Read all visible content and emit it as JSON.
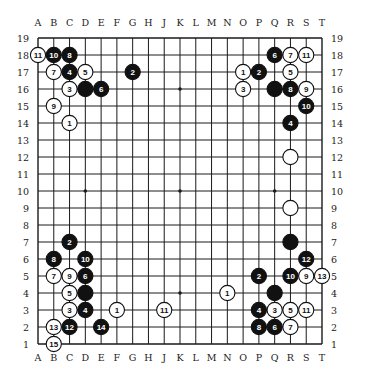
{
  "board": {
    "size": 19,
    "columns": [
      "A",
      "B",
      "C",
      "D",
      "E",
      "F",
      "G",
      "H",
      "J",
      "K",
      "L",
      "M",
      "N",
      "O",
      "P",
      "Q",
      "R",
      "S",
      "T"
    ],
    "rows": [
      19,
      18,
      17,
      16,
      15,
      14,
      13,
      12,
      11,
      10,
      9,
      8,
      7,
      6,
      5,
      4,
      3,
      2,
      1
    ],
    "star_points": [
      "D16",
      "K16",
      "Q16",
      "D10",
      "K10",
      "Q10",
      "D4",
      "K4",
      "Q4"
    ],
    "colors": {
      "line": "#1a1a1a",
      "black_stone": "#111111",
      "white_stone": "#ffffff",
      "background": "#ffffff"
    }
  },
  "stones": [
    {
      "pos": "A18",
      "color": "white",
      "label": "11"
    },
    {
      "pos": "B18",
      "color": "black",
      "label": "10"
    },
    {
      "pos": "C18",
      "color": "black",
      "label": "8"
    },
    {
      "pos": "B17",
      "color": "white",
      "label": "7"
    },
    {
      "pos": "C17",
      "color": "black",
      "label": "4"
    },
    {
      "pos": "D17",
      "color": "white",
      "label": "5"
    },
    {
      "pos": "G17",
      "color": "black",
      "label": "2"
    },
    {
      "pos": "C16",
      "color": "white",
      "label": "3"
    },
    {
      "pos": "D16",
      "color": "black",
      "label": ""
    },
    {
      "pos": "E16",
      "color": "black",
      "label": "6"
    },
    {
      "pos": "B15",
      "color": "white",
      "label": "9"
    },
    {
      "pos": "C14",
      "color": "white",
      "label": "1"
    },
    {
      "pos": "Q18",
      "color": "black",
      "label": "6"
    },
    {
      "pos": "R18",
      "color": "white",
      "label": "7"
    },
    {
      "pos": "S18",
      "color": "white",
      "label": "11"
    },
    {
      "pos": "O17",
      "color": "white",
      "label": "1"
    },
    {
      "pos": "P17",
      "color": "black",
      "label": "2"
    },
    {
      "pos": "R17",
      "color": "white",
      "label": "5"
    },
    {
      "pos": "O16",
      "color": "white",
      "label": "3"
    },
    {
      "pos": "Q16",
      "color": "black",
      "label": ""
    },
    {
      "pos": "R16",
      "color": "black",
      "label": "8"
    },
    {
      "pos": "S16",
      "color": "white",
      "label": "9"
    },
    {
      "pos": "S15",
      "color": "black",
      "label": "10"
    },
    {
      "pos": "R14",
      "color": "black",
      "label": "4"
    },
    {
      "pos": "R12",
      "color": "white",
      "label": ""
    },
    {
      "pos": "R9",
      "color": "white",
      "label": ""
    },
    {
      "pos": "R7",
      "color": "black",
      "label": ""
    },
    {
      "pos": "C7",
      "color": "black",
      "label": "2"
    },
    {
      "pos": "B6",
      "color": "black",
      "label": "8"
    },
    {
      "pos": "D6",
      "color": "black",
      "label": "10"
    },
    {
      "pos": "B5",
      "color": "white",
      "label": "7"
    },
    {
      "pos": "C5",
      "color": "white",
      "label": "9"
    },
    {
      "pos": "D5",
      "color": "black",
      "label": "6"
    },
    {
      "pos": "C4",
      "color": "white",
      "label": "5"
    },
    {
      "pos": "D4",
      "color": "black",
      "label": ""
    },
    {
      "pos": "C3",
      "color": "white",
      "label": "3"
    },
    {
      "pos": "D3",
      "color": "black",
      "label": "4"
    },
    {
      "pos": "F3",
      "color": "white",
      "label": "1"
    },
    {
      "pos": "J3",
      "color": "white",
      "label": "11"
    },
    {
      "pos": "B2",
      "color": "white",
      "label": "13"
    },
    {
      "pos": "C2",
      "color": "black",
      "label": "12"
    },
    {
      "pos": "E2",
      "color": "black",
      "label": "14"
    },
    {
      "pos": "B1",
      "color": "white",
      "label": "15"
    },
    {
      "pos": "S6",
      "color": "black",
      "label": "12"
    },
    {
      "pos": "P5",
      "color": "black",
      "label": "2"
    },
    {
      "pos": "R5",
      "color": "black",
      "label": "10"
    },
    {
      "pos": "S5",
      "color": "white",
      "label": "9"
    },
    {
      "pos": "T5",
      "color": "white",
      "label": "13"
    },
    {
      "pos": "N4",
      "color": "white",
      "label": "1"
    },
    {
      "pos": "Q4",
      "color": "black",
      "label": ""
    },
    {
      "pos": "P3",
      "color": "black",
      "label": "4"
    },
    {
      "pos": "Q3",
      "color": "white",
      "label": "3"
    },
    {
      "pos": "R3",
      "color": "white",
      "label": "5"
    },
    {
      "pos": "S3",
      "color": "white",
      "label": "11"
    },
    {
      "pos": "P2",
      "color": "black",
      "label": "8"
    },
    {
      "pos": "Q2",
      "color": "black",
      "label": "6"
    },
    {
      "pos": "R2",
      "color": "white",
      "label": "7"
    }
  ]
}
